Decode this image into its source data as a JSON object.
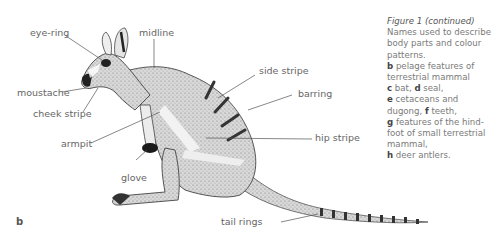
{
  "figure": {
    "panel_letter": "b",
    "labels": {
      "eye_ring": "eye-ring",
      "midline": "midline",
      "moustache": "moustache",
      "cheek_stripe": "cheek stripe",
      "side_stripe": "side stripe",
      "barring": "barring",
      "armpit": "armpit",
      "hip_stripe": "hip stripe",
      "glove": "glove",
      "tail_rings": "tail rings"
    },
    "caption": {
      "title": "Figure 1 (continued)",
      "intro": "Names used to describe body parts and colour patterns.",
      "items": [
        {
          "letter": "b",
          "text": " pelage features of terrestrial mammal"
        },
        {
          "letter": "c",
          "text": " bat, "
        },
        {
          "letter": "d",
          "text": " seal,"
        },
        {
          "letter": "e",
          "text": " cetaceans and dugong, "
        },
        {
          "letter": "f",
          "text": " teeth,"
        },
        {
          "letter": "g",
          "text": " features of the hind-foot of small terrestrial mammal,"
        },
        {
          "letter": "h",
          "text": " deer antlers."
        }
      ]
    }
  }
}
